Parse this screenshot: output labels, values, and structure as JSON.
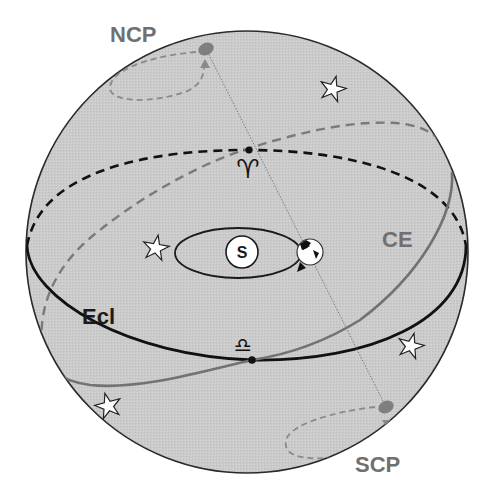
{
  "diagram": {
    "labels": {
      "ncp": "NCP",
      "scp": "SCP",
      "ecliptic": "Ecl",
      "celestial_equator": "CE",
      "sun": "S",
      "vernal_equinox_symbol": "♈",
      "autumnal_equinox_symbol": "♎"
    },
    "colors": {
      "background": "#ffffff",
      "sphere_fill": "#c9c9c9",
      "sphere_outline": "#2a2a2a",
      "ecliptic": "#111111",
      "celestial_equator": "#6e6e6e",
      "pole_marker": "#7a7a7a",
      "precession_path": "#8a8a8a",
      "label_gray": "#707070",
      "label_dark": "#1a1a1a",
      "star_fill": "#ffffff"
    },
    "elements": [
      "celestial-sphere",
      "ecliptic-circle",
      "celestial-equator-circle",
      "earth-axis-line",
      "north-celestial-pole",
      "south-celestial-pole",
      "sun",
      "earth-orbit",
      "earth",
      "vernal-equinox-point",
      "autumnal-equinox-point",
      "stars"
    ],
    "star_count": 5
  }
}
